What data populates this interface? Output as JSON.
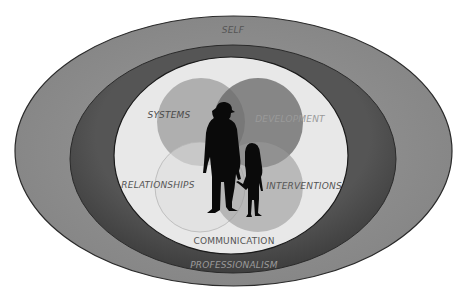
{
  "diagram": {
    "rings": {
      "outer": {
        "label": "SELF",
        "color": "#8c8c8c"
      },
      "middle": {
        "label": "PROFESSIONALISM",
        "color": "#4d4d4d"
      },
      "inner": {
        "color": "#e6e6e6"
      }
    },
    "venn": [
      {
        "label": "SYSTEMS",
        "color": "#9a9a9a"
      },
      {
        "label": "DEVELOPMENT",
        "color": "#6e6e6e"
      },
      {
        "label": "RELATIONSHIPS",
        "color": "#d9d9d9"
      },
      {
        "label": "INTERVENTIONS",
        "color": "#a8a8a8"
      }
    ],
    "bottom_label": "COMMUNICATION",
    "center_image": "adult-and-child-silhouette"
  }
}
